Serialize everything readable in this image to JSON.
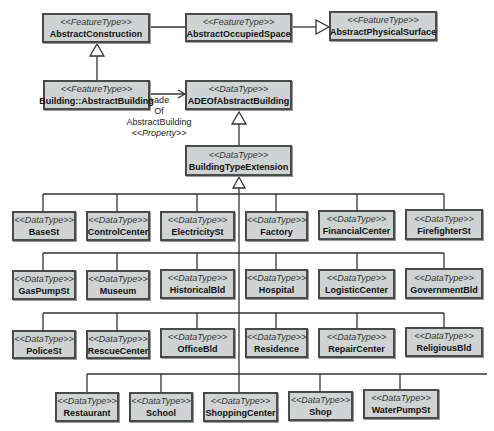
{
  "diagram": {
    "type": "UML class diagram",
    "colors": {
      "box_fill": "#cfd3d4",
      "box_border": "#4a4a4a",
      "line": "#333333"
    },
    "classes": {
      "abstract_construction": {
        "stereotype": "<<FeatureType>>",
        "name": "AbstractConstruction"
      },
      "abstract_occupied_space": {
        "stereotype": "<<FeatureType>>",
        "name": "AbstractOccupiedSpace"
      },
      "abstract_physical_surface": {
        "stereotype": "<<FeatureType>>",
        "name": "AbstractPhysicalSurface"
      },
      "abstract_building": {
        "stereotype": "<<FeatureType>>",
        "name": "Building::AbstractBuilding"
      },
      "ade_of_abstract_building": {
        "stereotype": "<<DataType>>",
        "name": "ADEOfAbstractBuilding"
      },
      "building_type_extension": {
        "stereotype": "<<DataType>>",
        "name": "BuildingTypeExtension"
      }
    },
    "association": {
      "role_line1": "+ade",
      "role_line2": "Of",
      "role_line3": "AbstractBuilding",
      "stereotype": "<<Property>>"
    },
    "subtypes": [
      {
        "stereotype": "<<DataType>>",
        "name": "BaseSt"
      },
      {
        "stereotype": "<<DataType>>",
        "name": "ControlCenter"
      },
      {
        "stereotype": "<<DataType>>",
        "name": "ElectricitySt"
      },
      {
        "stereotype": "<<DataType>>",
        "name": "Factory"
      },
      {
        "stereotype": "<<DataType>>",
        "name": "FinancialCenter"
      },
      {
        "stereotype": "<<DataType>>",
        "name": "FirefighterSt"
      },
      {
        "stereotype": "<<DataType>>",
        "name": "GasPumpSt"
      },
      {
        "stereotype": "<<DataType>>",
        "name": "Museum"
      },
      {
        "stereotype": "<<DataType>>",
        "name": "HistoricalBld"
      },
      {
        "stereotype": "<<DataType>>",
        "name": "Hospital"
      },
      {
        "stereotype": "<<DataType>>",
        "name": "LogisticCenter"
      },
      {
        "stereotype": "<<DataType>>",
        "name": "GovernmentBld"
      },
      {
        "stereotype": "<<DataType>>",
        "name": "PoliceSt"
      },
      {
        "stereotype": "<<DataType>>",
        "name": "RescueCenter"
      },
      {
        "stereotype": "<<DataType>>",
        "name": "OfficeBld"
      },
      {
        "stereotype": "<<DataType>>",
        "name": "Residence"
      },
      {
        "stereotype": "<<DataType>>",
        "name": "RepairCenter"
      },
      {
        "stereotype": "<<DataType>>",
        "name": "ReligiousBld"
      },
      {
        "stereotype": "<<DataType>>",
        "name": "Restaurant"
      },
      {
        "stereotype": "<<DataType>>",
        "name": "School"
      },
      {
        "stereotype": "<<DataType>>",
        "name": "ShoppingCenter"
      },
      {
        "stereotype": "<<DataType>>",
        "name": "Shop"
      },
      {
        "stereotype": "<<DataType>>",
        "name": "WaterPumpSt"
      }
    ]
  }
}
